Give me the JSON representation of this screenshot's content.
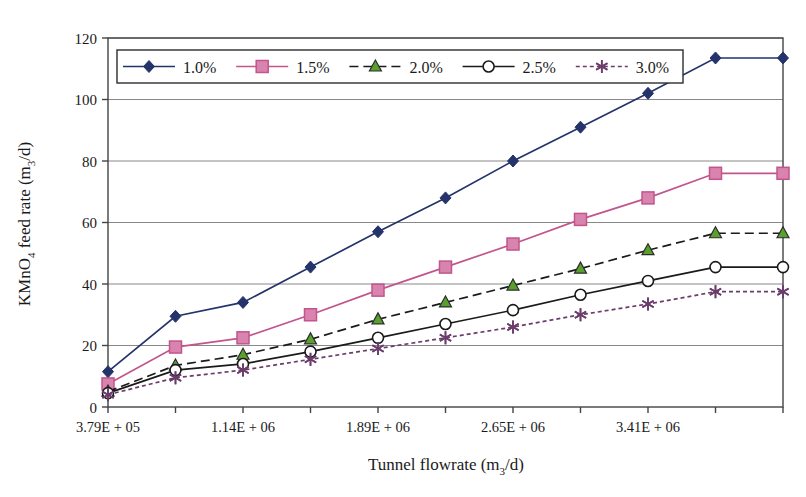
{
  "chart_data": {
    "type": "line",
    "title": "",
    "xlabel": "Tunnel flowrate (m3/d)",
    "ylabel": "KMnO4 feed rate (m3/d)",
    "ylim": [
      0,
      120
    ],
    "yticks": [
      0,
      20,
      40,
      60,
      80,
      100,
      120
    ],
    "grid": "horizontal",
    "legend_position": "top-inside",
    "x_index": [
      0,
      1,
      2,
      3,
      4,
      5,
      6,
      7,
      8,
      9,
      10
    ],
    "xtick_labels": [
      "3.79E + 05",
      "",
      "1.14E + 06",
      "",
      "1.89E + 06",
      "",
      "2.65E + 06",
      "",
      "3.41E + 06",
      "",
      ""
    ],
    "xtick_labels_visible": [
      "3.79E + 05",
      "1.14E + 06",
      "1.89E + 06",
      "2.65E + 06",
      "3.41E + 06"
    ],
    "categories": [
      "3.79E + 05",
      "7.58E + 05",
      "1.14E + 06",
      "1.51E + 06",
      "1.89E + 06",
      "2.27E + 06",
      "2.65E + 06",
      "3.03E + 06",
      "3.41E + 06",
      "3.79E + 06",
      "4.17E + 06"
    ],
    "series": [
      {
        "name": "1.0%",
        "color": "#24346b",
        "marker": "diamond",
        "dash": "solid",
        "values": [
          11.5,
          29.5,
          34,
          45.5,
          57,
          68,
          80,
          91,
          102,
          113.5,
          113.5
        ]
      },
      {
        "name": "1.5%",
        "color": "#c2558c",
        "marker": "square",
        "dash": "solid",
        "values": [
          7.5,
          19.5,
          22.5,
          30,
          38,
          45.5,
          53,
          61,
          68,
          76,
          76
        ]
      },
      {
        "name": "2.0%",
        "color": "#1a1a1a",
        "marker": "triangle",
        "dash": "dashed",
        "marker_color": "#5aa02c",
        "values": [
          5,
          13.5,
          17,
          22,
          28.5,
          34,
          39.5,
          45,
          51,
          56.5,
          56.5
        ]
      },
      {
        "name": "2.5%",
        "color": "#1a1a1a",
        "marker": "circle",
        "dash": "solid",
        "values": [
          4.5,
          12,
          14,
          18,
          22.5,
          27,
          31.5,
          36.5,
          41,
          45.5,
          45.5
        ]
      },
      {
        "name": "3.0%",
        "color": "#6b3d6b",
        "marker": "asterisk",
        "dash": "dotted",
        "values": [
          4,
          9.5,
          12,
          15.5,
          19,
          22.5,
          26,
          30,
          33.5,
          37.5,
          37.5
        ]
      }
    ]
  },
  "legend": {
    "entries": [
      {
        "label": "1.0%"
      },
      {
        "label": "1.5%"
      },
      {
        "label": "2.0%"
      },
      {
        "label": "2.5%"
      },
      {
        "label": "3.0%"
      }
    ]
  },
  "axes": {
    "y_label_main": "KMnO",
    "y_label_sub1": "4",
    "y_label_mid": " feed rate (m",
    "y_label_sub2": "3",
    "y_label_end": "/d)",
    "x_label_main": "Tunnel flowrate (m",
    "x_label_sub": "3",
    "x_label_end": "/d)",
    "ytick_0": "0",
    "ytick_20": "20",
    "ytick_40": "40",
    "ytick_60": "60",
    "ytick_80": "80",
    "ytick_100": "100",
    "ytick_120": "120",
    "xtick_0": "3.79E + 05",
    "xtick_2": "1.14E + 06",
    "xtick_4": "1.89E + 06",
    "xtick_6": "2.65E + 06",
    "xtick_8": "3.41E + 06"
  },
  "colors": {
    "series_1_0": "#24346b",
    "series_1_5": "#c2558c",
    "series_2_0_marker": "#5aa02c",
    "series_2_5": "#1a1a1a",
    "series_3_0": "#6b3d6b",
    "grid": "#888888",
    "axis": "#444444",
    "background": "#ffffff"
  }
}
